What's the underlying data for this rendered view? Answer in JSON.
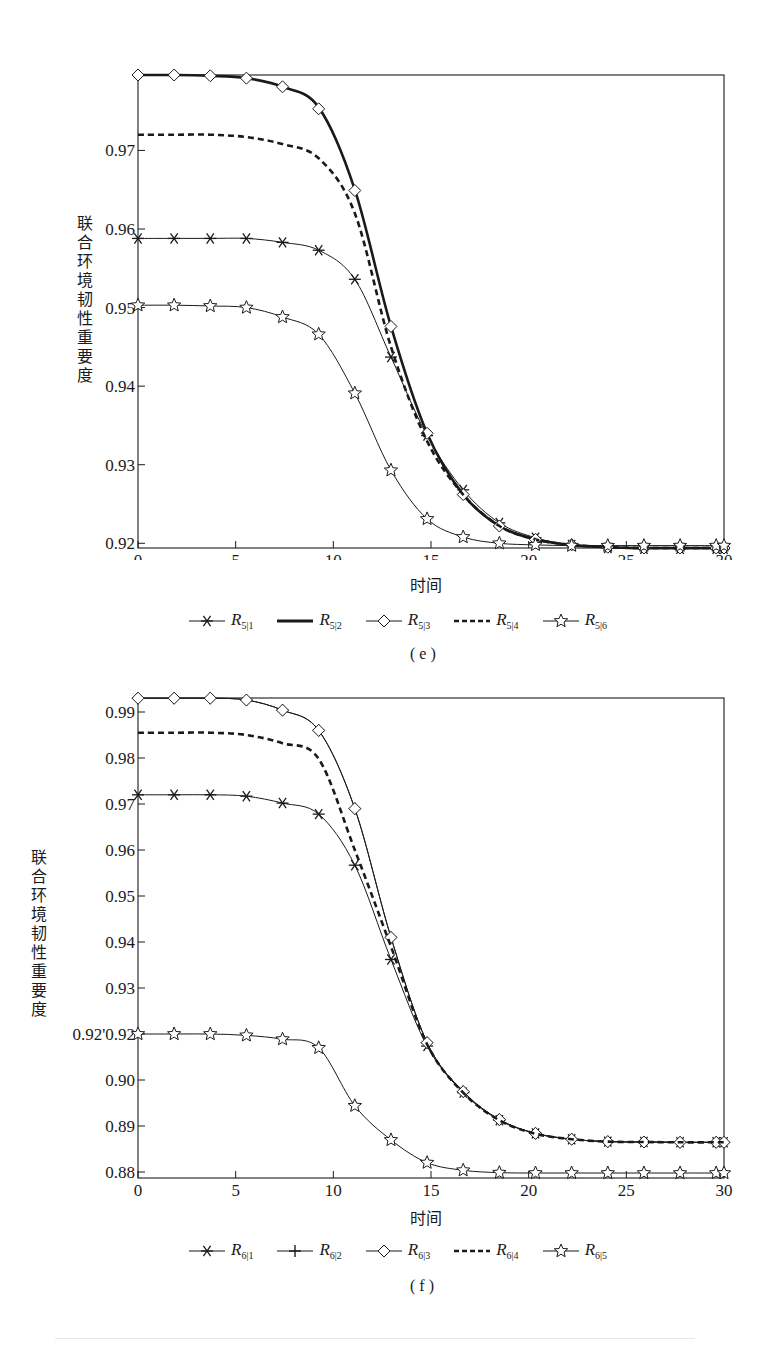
{
  "chart_data": [
    {
      "type": "line",
      "panel": "(e)",
      "caption": "( e )",
      "xlabel": "时间",
      "ylabel": "联合环境韧性重要度",
      "xlim": [
        0,
        30
      ],
      "ylim": [
        0.9194,
        0.9796
      ],
      "xticks": [
        0,
        5,
        10,
        15,
        20,
        25,
        30
      ],
      "yticks": [
        0.92,
        0.93,
        0.94,
        0.95,
        0.96,
        0.97
      ],
      "ytick_labels": [
        "0.92",
        "0.93",
        "0.94",
        "0.95",
        "0.96",
        "0.97"
      ],
      "grid": false,
      "legend_position": "bottom",
      "x": [
        0,
        1.85,
        3.7,
        5.55,
        7.4,
        9.25,
        11.1,
        12.95,
        14.8,
        16.65,
        18.5,
        20.35,
        22.2,
        24.05,
        25.9,
        27.75,
        29.6
      ],
      "series": [
        {
          "name": "R5|1",
          "label_main": "R",
          "label_sub": "5|1",
          "marker": "asterisk",
          "style": "solid-thin",
          "values": [
            0.9588,
            0.9588,
            0.9588,
            0.9588,
            0.9583,
            0.9573,
            0.9536,
            0.9437,
            0.9337,
            0.9268,
            0.9226,
            0.9207,
            0.9198,
            0.9194,
            0.9193,
            0.9193,
            0.9193
          ]
        },
        {
          "name": "R5|2",
          "label_main": "R",
          "label_sub": "5|2",
          "marker": "none",
          "style": "solid-thick",
          "values": [
            0.9796,
            0.9796,
            0.9795,
            0.9792,
            0.9781,
            0.9755,
            0.965,
            0.9476,
            0.934,
            0.9262,
            0.9222,
            0.9205,
            0.9198,
            0.9195,
            0.9194,
            0.9194,
            0.9194
          ]
        },
        {
          "name": "R5|3",
          "label_main": "R",
          "label_sub": "5|3",
          "marker": "diamond",
          "style": "solid-thin",
          "values": [
            0.9796,
            0.9796,
            0.9795,
            0.9792,
            0.9781,
            0.9753,
            0.9649,
            0.9476,
            0.934,
            0.9262,
            0.9222,
            0.9205,
            0.9198,
            0.9195,
            0.9194,
            0.9194,
            0.9194
          ]
        },
        {
          "name": "R5|4",
          "label_main": "R",
          "label_sub": "5|4",
          "marker": "none",
          "style": "dashed-thick",
          "values": [
            0.972,
            0.972,
            0.972,
            0.9717,
            0.9708,
            0.969,
            0.962,
            0.945,
            0.933,
            0.9262,
            0.9222,
            0.9205,
            0.9198,
            0.9195,
            0.9194,
            0.9194,
            0.9194
          ]
        },
        {
          "name": "R5|6",
          "label_main": "R",
          "label_sub": "5|6",
          "marker": "star",
          "style": "solid-thin",
          "values": [
            0.9503,
            0.9503,
            0.9502,
            0.95,
            0.9488,
            0.9466,
            0.9391,
            0.9293,
            0.9231,
            0.9208,
            0.92,
            0.9198,
            0.9197,
            0.9197,
            0.9197,
            0.9197,
            0.9197
          ]
        }
      ]
    },
    {
      "type": "line",
      "panel": "(f)",
      "caption": "( f )",
      "xlabel": "时间",
      "ylabel": "联合环境韧性重要度",
      "xlim": [
        0,
        30
      ],
      "ylim": [
        0.8788,
        0.993
      ],
      "xticks": [
        0,
        5,
        10,
        15,
        20,
        25,
        30
      ],
      "yticks_pixel_order": [
        "0.99",
        "0.98",
        "0.97",
        "0.96",
        "0.95",
        "0.94",
        "0.93",
        "0.92'0.92",
        "0.90",
        "0.89",
        "0.88"
      ],
      "ytick_labels": [
        "0.88",
        "0.89",
        "0.90",
        "0.92'0.92",
        "0.93",
        "0.94",
        "0.95",
        "0.96",
        "0.97",
        "0.98",
        "0.99"
      ],
      "ytick_positions": [
        0.88,
        0.89,
        0.9,
        0.91,
        0.92,
        0.93,
        0.94,
        0.95,
        0.96,
        0.97,
        0.98,
        0.99
      ],
      "grid": false,
      "legend_position": "bottom",
      "x": [
        0,
        1.85,
        3.7,
        5.55,
        7.4,
        9.25,
        11.1,
        12.95,
        14.8,
        16.65,
        18.5,
        20.35,
        22.2,
        24.05,
        25.9,
        27.75,
        29.6
      ],
      "series": [
        {
          "name": "R6|1",
          "label_main": "R",
          "label_sub": "6|1",
          "marker": "asterisk",
          "style": "solid-thin",
          "values": [
            0.972,
            0.972,
            0.972,
            0.9717,
            0.9702,
            0.9678,
            0.9567,
            0.9362,
            0.9165,
            0.903,
            0.895,
            0.8912,
            0.8895,
            0.8888,
            0.8887,
            0.8886,
            0.8886
          ]
        },
        {
          "name": "R6|2",
          "label_main": "R",
          "label_sub": "6|2",
          "marker": "plus",
          "style": "solid-thin",
          "values": [
            0.993,
            0.993,
            0.993,
            0.9926,
            0.9904,
            0.986,
            0.969,
            0.941,
            0.9175,
            0.9033,
            0.8952,
            0.8912,
            0.8895,
            0.8888,
            0.8887,
            0.8886,
            0.8886
          ]
        },
        {
          "name": "R6|3",
          "label_main": "R",
          "label_sub": "6|3",
          "marker": "diamond",
          "style": "solid-thin",
          "values": [
            0.993,
            0.993,
            0.993,
            0.9926,
            0.9904,
            0.986,
            0.969,
            0.941,
            0.9175,
            0.9033,
            0.8952,
            0.8912,
            0.8895,
            0.8888,
            0.8887,
            0.8886,
            0.8886
          ]
        },
        {
          "name": "R6|4",
          "label_main": "R",
          "label_sub": "6|4",
          "marker": "none",
          "style": "dashed-thick",
          "values": [
            0.9855,
            0.9855,
            0.9855,
            0.985,
            0.9832,
            0.9798,
            0.96,
            0.939,
            0.917,
            0.903,
            0.895,
            0.8911,
            0.8895,
            0.8888,
            0.8887,
            0.8886,
            0.8886
          ]
        },
        {
          "name": "R6|5",
          "label_main": "R",
          "label_sub": "6|5",
          "marker": "star",
          "style": "solid-thin",
          "values": [
            0.92,
            0.92,
            0.92,
            0.9196,
            0.9185,
            0.916,
            0.8992,
            0.8893,
            0.8827,
            0.8805,
            0.8798,
            0.8797,
            0.8797,
            0.8797,
            0.8797,
            0.8797,
            0.8797
          ]
        }
      ]
    }
  ],
  "charts": {
    "e": {
      "xlabel": "时间",
      "ylabel": "联合环境韧性重要度",
      "caption": "( e )",
      "xtick_labels": [
        "0",
        "5",
        "10",
        "15",
        "20",
        "25",
        "30"
      ],
      "ytick_labels": [
        "0.97",
        "0.96",
        "0.95",
        "0.94",
        "0.93",
        "0.92"
      ],
      "legend": [
        {
          "main": "R",
          "sub": "5|1",
          "marker": "asterisk"
        },
        {
          "main": "R",
          "sub": "5|2",
          "marker": "thick"
        },
        {
          "main": "R",
          "sub": "5|3",
          "marker": "diamond"
        },
        {
          "main": "R",
          "sub": "5|4",
          "marker": "dashed"
        },
        {
          "main": "R",
          "sub": "5|6",
          "marker": "star"
        }
      ]
    },
    "f": {
      "xlabel": "时间",
      "ylabel": "联合环境韧性重要度",
      "caption": "( f )",
      "xtick_labels": [
        "0",
        "5",
        "10",
        "15",
        "20",
        "25",
        "30"
      ],
      "ytick_labels": [
        "0.99",
        "0.98",
        "0.97",
        "0.96",
        "0.95",
        "0.94",
        "0.93",
        "0.92'0.92",
        "0.90",
        "0.89",
        "0.88"
      ],
      "legend": [
        {
          "main": "R",
          "sub": "6|1",
          "marker": "asterisk"
        },
        {
          "main": "R",
          "sub": "6|2",
          "marker": "plus"
        },
        {
          "main": "R",
          "sub": "6|3",
          "marker": "diamond"
        },
        {
          "main": "R",
          "sub": "6|4",
          "marker": "dashed"
        },
        {
          "main": "R",
          "sub": "6|5",
          "marker": "star"
        }
      ]
    }
  },
  "colors": {
    "ink": "#1a1a1a",
    "background": "#ffffff"
  }
}
